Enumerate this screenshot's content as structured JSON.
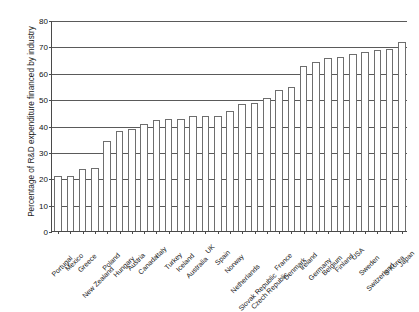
{
  "chart_data": {
    "type": "bar",
    "title": "",
    "xlabel": "",
    "ylabel": "Percentage of R&D expenditure financed by industry",
    "ylim": [
      0,
      80
    ],
    "ytick_labels": [
      "0",
      "10",
      "20",
      "30",
      "40",
      "50",
      "60",
      "70",
      "80"
    ],
    "ytick_values": [
      0,
      10,
      20,
      30,
      40,
      50,
      60,
      70,
      80
    ],
    "grid": "horizontal",
    "legend": "none",
    "categories": [
      "Portugal",
      "Mexico",
      "Greece",
      "New Zealand",
      "Poland",
      "Hungary",
      "Austria",
      "Canada",
      "Italy",
      "Turkey",
      "Iceland",
      "Australia",
      "UK",
      "Spain",
      "Norway",
      "Netherlands",
      "Slovak Republic",
      "Czech Republic",
      "France",
      "Denmark",
      "Ireland",
      "Germany",
      "Belgium",
      "Finland",
      "USA",
      "Sweden",
      "Switzerland",
      "S Korea",
      "Japan"
    ],
    "values": [
      21,
      21,
      23.5,
      24,
      34,
      38,
      38.5,
      40.5,
      42,
      42.5,
      42.5,
      43.5,
      43.5,
      43.5,
      45.5,
      48,
      48.5,
      50.5,
      53.5,
      54.5,
      62.5,
      64,
      65.5,
      66,
      67,
      68,
      68.5,
      69,
      71.5
    ]
  }
}
